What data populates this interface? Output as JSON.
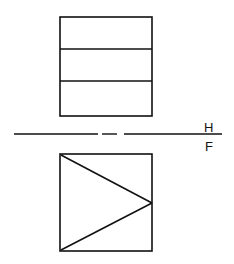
{
  "diagram": {
    "type": "orthographic-projection",
    "stroke_color": "#111111",
    "background": "#ffffff",
    "fold_line": {
      "label_top": "H",
      "label_bottom": "F",
      "y": 134,
      "segments": [
        [
          14,
          98
        ],
        [
          102,
          117
        ],
        [
          124,
          222
        ]
      ]
    },
    "top_view": {
      "name": "horizontal-view",
      "rect": {
        "x": 60,
        "y": 17,
        "w": 92,
        "h": 99
      },
      "dividers_y": [
        49,
        81
      ]
    },
    "front_view": {
      "name": "frontal-view",
      "rect": {
        "x": 60,
        "y": 154,
        "w": 92,
        "h": 97
      },
      "triangle": [
        [
          61,
          155
        ],
        [
          152,
          203
        ],
        [
          61,
          250
        ]
      ]
    }
  }
}
